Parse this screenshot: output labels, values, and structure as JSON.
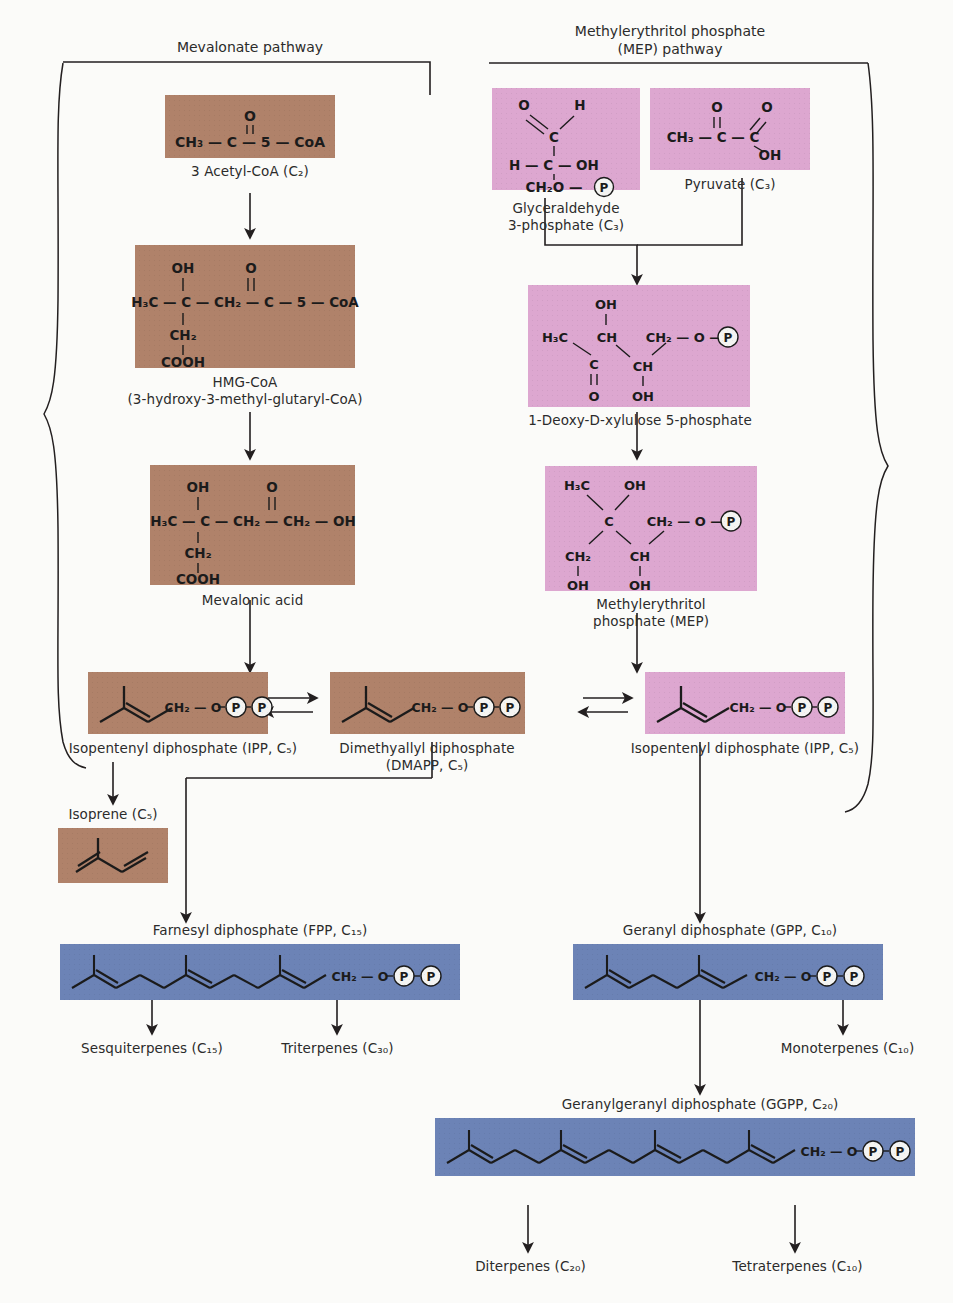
{
  "figure": {
    "type": "biochemical-pathway-diagram",
    "colors": {
      "mevalonate_box": "#b0826a",
      "mep_box": "#dda7d0",
      "prenyl_box": "#6c83b6",
      "background": "#fbfbf9",
      "line": "#231f20"
    }
  },
  "pathways": {
    "left": {
      "name": "Mevalonate pathway"
    },
    "right": {
      "name_line1": "Methylerythritol phosphate",
      "name_line2": "(MEP) pathway"
    }
  },
  "compounds": {
    "acetyl_coa": {
      "label": "3 Acetyl-CoA (C₂)",
      "formula": "CH₃ — C — 5 — CoA",
      "top_atom": "O"
    },
    "hmg_coa": {
      "label_line1": "HMG-CoA",
      "label_line2": "(3-hydroxy-3-methyl-glutaryl-CoA)",
      "backbone": "H₃C — C — CH₂ — C — 5 — CoA",
      "up_left": "OH",
      "up_right": "O",
      "down1": "CH₂",
      "down2": "COOH"
    },
    "mevalonic": {
      "label": "Mevalonic acid",
      "backbone": "H₃C — C — CH₂ — CH₂ — OH",
      "up_left": "OH",
      "up_right": "O",
      "down1": "CH₂",
      "down2": "COOH"
    },
    "g3p": {
      "label_line1": "Glyceraldehyde",
      "label_line2": "3-phosphate (C₃)",
      "a_o": "O",
      "a_h": "H",
      "a_c": "C",
      "b_h": "H",
      "b_c": "C",
      "b_oh": "OH",
      "c_ch2o": "CH₂O",
      "c_p": "P"
    },
    "pyruvate": {
      "label": "Pyruvate (C₃)",
      "ch3": "CH₃",
      "c1": "C",
      "c2": "C",
      "o_top1": "O",
      "o_top2": "O",
      "oh": "OH"
    },
    "dxp": {
      "label": "1-Deoxy-D-xylulose 5-phosphate",
      "h3c": "H₃C",
      "oh_top": "OH",
      "ch_top": "CH",
      "ch2": "CH₂",
      "o_link": "O",
      "p": "P",
      "c": "C",
      "o_dbl": "O",
      "ch_bot": "CH",
      "oh_bot": "OH"
    },
    "mep": {
      "label_line1": "Methylerythritol",
      "label_line2": "phosphate (MEP)",
      "h3c": "H₃C",
      "oh_top": "OH",
      "c": "C",
      "ch2_left": "CH₂",
      "ch_mid": "CH",
      "oh_left": "OH",
      "oh_mid": "OH",
      "ch2_right": "CH₂",
      "o_link": "O",
      "p": "P"
    },
    "ipp_left": {
      "label": "Isopentenyl diphosphate (IPP, C₅)",
      "ch2": "CH₂",
      "o": "O",
      "p1": "P",
      "p2": "P"
    },
    "dmapp": {
      "label_line1": "Dimethyallyl diphosphate",
      "label_line2": "(DMAPP, C₅)",
      "ch2": "CH₂",
      "o": "O",
      "p1": "P",
      "p2": "P"
    },
    "ipp_right": {
      "label": "Isopentenyl diphosphate (IPP, C₅)",
      "ch2": "CH₂",
      "o": "O",
      "p1": "P",
      "p2": "P"
    },
    "isoprene": {
      "label": "Isoprene (C₅)"
    },
    "fpp": {
      "label": "Farnesyl diphosphate (FPP, C₁₅)",
      "ch2": "CH₂",
      "o": "O",
      "p1": "P",
      "p2": "P"
    },
    "gpp": {
      "label": "Geranyl diphosphate (GPP, C₁₀)",
      "ch2": "CH₂",
      "o": "O",
      "p1": "P",
      "p2": "P"
    },
    "ggpp": {
      "label": "Geranylgeranyl diphosphate (GGPP, C₂₀)",
      "ch2": "CH₂",
      "o": "O",
      "p1": "P",
      "p2": "P"
    }
  },
  "products": {
    "sesquiterpenes": "Sesquiterpenes (C₁₅)",
    "triterpenes": "Triterpenes (C₃₀)",
    "monoterpenes": "Monoterpenes (C₁₀)",
    "diterpenes": "Diterpenes (C₂₀)",
    "tetraterpenes": "Tetraterpenes (C₁₀)"
  }
}
